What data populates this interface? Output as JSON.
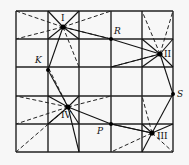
{
  "diagram": {
    "type": "grid-point-diagram",
    "grid": {
      "columns": 5,
      "rows": 5
    },
    "points": [
      {
        "id": "I",
        "label": "I"
      },
      {
        "id": "II",
        "label": "II"
      },
      {
        "id": "III",
        "label": "III"
      },
      {
        "id": "IV",
        "label": "IV"
      },
      {
        "id": "R",
        "label": "R"
      },
      {
        "id": "K",
        "label": "K"
      },
      {
        "id": "S",
        "label": "S"
      },
      {
        "id": "P",
        "label": "P"
      }
    ],
    "solid_connections": [
      [
        "I",
        "R"
      ],
      [
        "R",
        "II"
      ],
      [
        "I",
        "K"
      ],
      [
        "K",
        "IV"
      ],
      [
        "IV",
        "P"
      ],
      [
        "P",
        "III"
      ],
      [
        "III",
        "S"
      ],
      [
        "S",
        "II"
      ]
    ],
    "colors": {
      "lines": "#111111",
      "background": "#f7f7f7"
    }
  }
}
